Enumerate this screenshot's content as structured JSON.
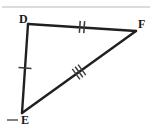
{
  "figure": {
    "kind": "geometry-triangle-diagram",
    "background_color": "#ffffff",
    "stroke_color": "#231f20",
    "tick_color": "#3a3a3a",
    "rule_color": "#b9b9b9",
    "width": 151,
    "height": 131
  },
  "top_rule": {
    "name": "horizontal-divider",
    "y": 7,
    "x1": 2,
    "x2": 150,
    "color": "#b9b9b9"
  },
  "triangle": {
    "name": "triangle-DEF",
    "vertices": [
      {
        "id": "D",
        "label": "D",
        "x": 28,
        "y": 24
      },
      {
        "id": "F",
        "label": "F",
        "x": 136,
        "y": 31
      },
      {
        "id": "E",
        "label": "E",
        "x": 22,
        "y": 113
      }
    ],
    "edges": [
      {
        "id": "DF",
        "from": "D",
        "to": "F",
        "tick_count": 2,
        "tick_label": "||"
      },
      {
        "id": "FE",
        "from": "F",
        "to": "E",
        "tick_count": 3,
        "tick_label": "|||"
      },
      {
        "id": "ED",
        "from": "E",
        "to": "D",
        "tick_count": 1,
        "tick_label": "|"
      }
    ]
  },
  "tick_marks": [
    {
      "name": "tick-DF-double",
      "edge": "DF",
      "x": 82,
      "y": 27,
      "count": 2,
      "angle_deg": 4
    },
    {
      "name": "tick-EF-triple",
      "edge": "FE",
      "x": 79,
      "y": 72,
      "count": 3,
      "angle_deg": 39
    },
    {
      "name": "tick-DE-single",
      "edge": "ED",
      "x": 25,
      "y": 68,
      "count": 1,
      "angle_deg": 94
    }
  ],
  "label_dash": {
    "name": "dash-left-of-E",
    "x1": 7,
    "x2": 18,
    "y": 120,
    "color": "#4a4a4a"
  }
}
